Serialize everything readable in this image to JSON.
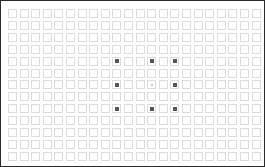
{
  "canvas": {
    "width": 265,
    "height": 167,
    "background_color": "#ffffff",
    "border_color": "#2b2b2b",
    "description": "Grid of empty square outlines with a sparse 3x3 arrangement of filled center markers"
  },
  "grid": {
    "columns": 22,
    "rows": 13,
    "cell_size": 9,
    "cell_pitch_x": 11.6,
    "cell_pitch_y": 11.9,
    "offset_x": 7,
    "offset_y": 8,
    "cell_outline_color": "#dcdcdc",
    "cell_fill_color": "transparent"
  },
  "markers": {
    "color": "#555555",
    "faint_color": "#c8c8c8",
    "size": 4,
    "faint_size": 2,
    "count": 9,
    "pattern": "3x3",
    "items": [
      {
        "row": 4,
        "col": 9,
        "faint": false
      },
      {
        "row": 4,
        "col": 12,
        "faint": false
      },
      {
        "row": 4,
        "col": 14,
        "faint": false
      },
      {
        "row": 6,
        "col": 9,
        "faint": false
      },
      {
        "row": 6,
        "col": 12,
        "faint": true
      },
      {
        "row": 6,
        "col": 14,
        "faint": false
      },
      {
        "row": 8,
        "col": 9,
        "faint": false
      },
      {
        "row": 8,
        "col": 12,
        "faint": false
      },
      {
        "row": 8,
        "col": 14,
        "faint": false
      }
    ]
  }
}
